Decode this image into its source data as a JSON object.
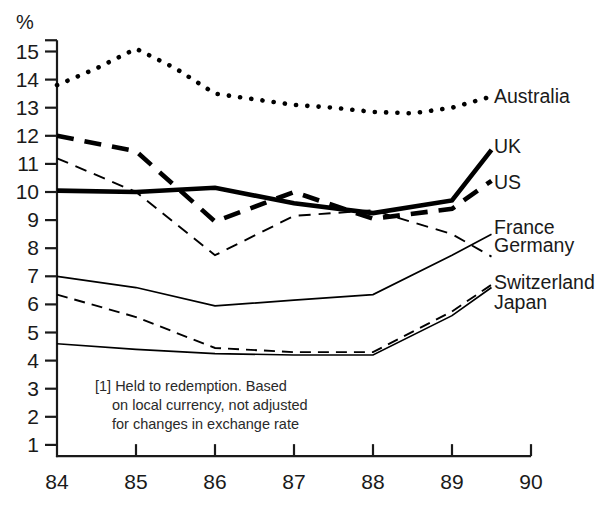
{
  "chart_data": {
    "type": "line",
    "title": "",
    "subtitle": "",
    "xlabel": "",
    "ylabel": "%",
    "unit_label": "%",
    "xlim": [
      84,
      90
    ],
    "ylim": [
      0.4,
      15.4
    ],
    "grid": false,
    "legend_position": "right-inline",
    "x_tick_labels": [
      "84",
      "85",
      "86",
      "87",
      "88",
      "89",
      "90"
    ],
    "y_tick_labels": [
      "15",
      "14",
      "13",
      "12",
      "11",
      "10",
      "9",
      "8",
      "7",
      "6",
      "5",
      "4",
      "3",
      "2",
      "1"
    ],
    "x_ticks": [
      84,
      85,
      86,
      87,
      88,
      89,
      90
    ],
    "y_ticks": [
      15,
      14,
      13,
      12,
      11,
      10,
      9,
      8,
      7,
      6,
      5,
      4,
      3,
      2,
      1
    ],
    "footnote": "[1] Held to redemption. Based on local currency, not adjusted for changes in exchange rate",
    "footnote_lines": [
      "[1] Held to redemption. Based",
      "on local currency, not adjusted",
      "for changes in exchange rate"
    ],
    "series": [
      {
        "name": "Australia",
        "style": "dotted",
        "color": "#000000",
        "x": [
          84,
          84.5,
          85,
          85.5,
          86,
          86.5,
          87,
          87.5,
          88,
          88.5,
          89,
          89.5
        ],
        "values": [
          13.8,
          14.4,
          15.1,
          14.4,
          13.5,
          13.3,
          13.1,
          13.0,
          12.85,
          12.8,
          13.0,
          13.4
        ]
      },
      {
        "name": "UK",
        "style": "solid-thick",
        "color": "#000000",
        "x": [
          84,
          85,
          86,
          87,
          88,
          89,
          89.5
        ],
        "values": [
          10.05,
          10.0,
          10.15,
          9.6,
          9.25,
          9.7,
          11.5
        ]
      },
      {
        "name": "US",
        "style": "dashed-thick",
        "color": "#000000",
        "x": [
          84,
          85,
          86,
          87,
          88,
          89,
          89.5
        ],
        "values": [
          12.0,
          11.45,
          8.95,
          10.0,
          9.05,
          9.4,
          10.4
        ]
      },
      {
        "name": "France",
        "style": "solid-thin",
        "color": "#000000",
        "x": [
          84,
          85,
          86,
          87,
          88,
          89,
          89.5
        ],
        "values": [
          7.0,
          6.6,
          5.95,
          6.15,
          6.35,
          7.75,
          8.5
        ]
      },
      {
        "name": "Germany",
        "style": "dashed-thin",
        "color": "#000000",
        "x": [
          84,
          85,
          86,
          87,
          88,
          89,
          89.5
        ],
        "values": [
          11.2,
          10.0,
          7.75,
          9.15,
          9.35,
          8.5,
          7.7
        ]
      },
      {
        "name": "Switzerland",
        "style": "solid-thin",
        "color": "#000000",
        "x": [
          84,
          85,
          86,
          87,
          88,
          89,
          89.5
        ],
        "values": [
          4.6,
          4.4,
          4.25,
          4.2,
          4.2,
          5.6,
          6.6
        ]
      },
      {
        "name": "Japan",
        "style": "dashed-thin",
        "color": "#000000",
        "x": [
          84,
          85,
          86,
          87,
          88,
          89,
          89.5
        ],
        "values": [
          6.35,
          5.55,
          4.45,
          4.3,
          4.3,
          5.75,
          6.7
        ]
      }
    ],
    "series_labels": [
      {
        "name": "Australia",
        "label": "Australia",
        "x": 494,
        "y": 103
      },
      {
        "name": "UK",
        "label": "UK",
        "x": 494,
        "y": 153
      },
      {
        "name": "US",
        "label": "US",
        "x": 494,
        "y": 189
      },
      {
        "name": "France",
        "label": "France",
        "x": 494,
        "y": 234
      },
      {
        "name": "Germany",
        "label": "Germany",
        "x": 494,
        "y": 252
      },
      {
        "name": "Switzerland",
        "label": "Switzerland",
        "x": 494,
        "y": 289
      },
      {
        "name": "Japan",
        "label": "Japan",
        "x": 494,
        "y": 309
      }
    ]
  }
}
